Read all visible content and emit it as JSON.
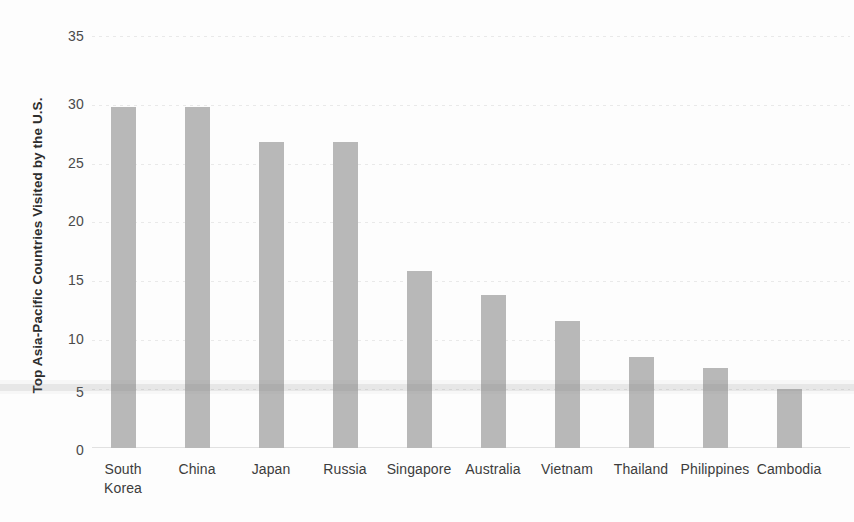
{
  "chart_data": {
    "type": "bar",
    "title": "",
    "subtitle": "",
    "xlabel": "",
    "ylabel": "Top Asia-Pacific Countries Visited by the U.S.",
    "categories": [
      "South\nKorea",
      "China",
      "Japan",
      "Russia",
      "Singapore",
      "Australia",
      "Vietnam",
      "Thailand",
      "Philippines",
      "Cambodia"
    ],
    "values": [
      29,
      29,
      26,
      26,
      15,
      13,
      10.8,
      7.7,
      6.8,
      5
    ],
    "ylim": [
      0,
      35
    ],
    "yticks": [
      0,
      5,
      10,
      15,
      20,
      25,
      30,
      35
    ],
    "ytick_labels": [
      "0",
      "5",
      "10",
      "15",
      "20",
      "25",
      "30",
      "35"
    ],
    "grid": true,
    "grid_axis": "y",
    "legend": false,
    "legend_position": "none",
    "bar_color": "#b8b8b8",
    "background_color": "#fdfdfd",
    "gridline_color": "#e6e6e6",
    "text_color": "#3c3c3c"
  }
}
